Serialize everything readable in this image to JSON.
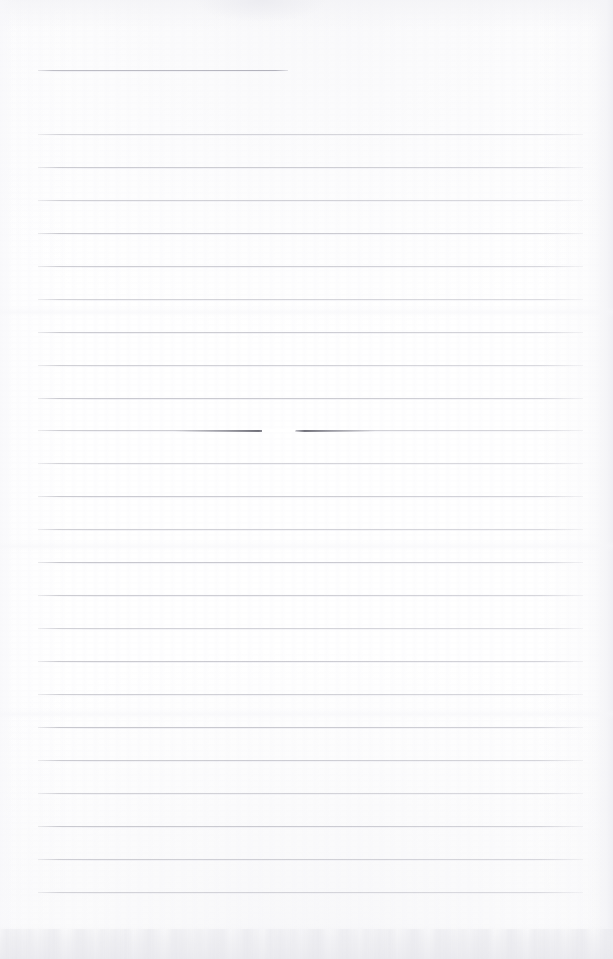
{
  "document": {
    "type": "scanned-blank-lined-paper",
    "title_visible": "",
    "page_width": 613,
    "page_height": 959,
    "background_color": "#ffffff",
    "rule_color": "#c9c9d0",
    "header_rule_color": "#babac2",
    "shadow_color": "#ececf0",
    "written_content": "",
    "notes": "Blank ruled notebook page scan; no text, no handwriting visible"
  },
  "header_rule": {
    "name": "title-rule",
    "x": 38,
    "y": 70,
    "width": 250
  },
  "ruled_lines": {
    "left": 38,
    "right": 583,
    "width": 545,
    "spacing": 33,
    "count": 24,
    "y_positions": [
      134,
      167,
      200,
      233,
      266,
      299,
      332,
      365,
      398,
      430,
      463,
      496,
      529,
      562,
      595,
      628,
      661,
      694,
      727,
      760,
      793,
      826,
      859,
      892
    ]
  },
  "artifacts": {
    "crease": {
      "name": "crease-smudge",
      "on_line_y": 430,
      "segment_a_x": 175,
      "segment_a_width": 95,
      "gap_x": 262,
      "gap_width": 34,
      "segment_b_x": 295,
      "segment_b_width": 80
    },
    "bottom_shadow": {
      "y": 925,
      "height": 34
    },
    "top_haze": {
      "y": 0,
      "height": 30
    },
    "top_blotch": {
      "x": 196,
      "width": 130
    },
    "right_edge_shade": {
      "x": 591,
      "width": 22
    },
    "mid_washes": [
      312,
      546,
      714
    ]
  }
}
